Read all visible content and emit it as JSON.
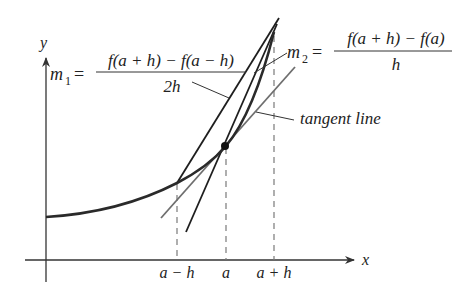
{
  "diagram": {
    "axes": {
      "x_label": "x",
      "y_label": "y"
    },
    "ticks": [
      {
        "label": "a − h",
        "x": 177
      },
      {
        "label": "a",
        "x": 226
      },
      {
        "label": "a + h",
        "x": 274
      }
    ],
    "formulas": {
      "m1": {
        "lhs": "m",
        "sub": "1",
        "eq": "=",
        "numerator": "f(a + h) − f(a − h)",
        "denominator": "2h"
      },
      "m2": {
        "lhs": "m",
        "sub": "2",
        "eq": "=",
        "numerator": "f(a + h) − f(a)",
        "denominator": "h"
      }
    },
    "annotations": {
      "tangent": "tangent line"
    },
    "colors": {
      "curve": "#2a2a2a",
      "secant": "#1e1e1e",
      "tangent": "#6e6e6e",
      "dashed": "#7a7a7a",
      "axis": "#333333"
    }
  }
}
